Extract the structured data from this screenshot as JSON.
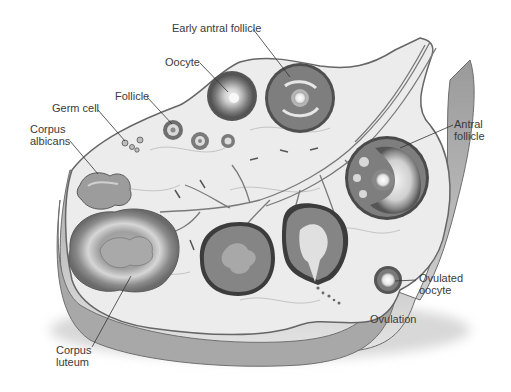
{
  "diagram": {
    "labels": {
      "early_antral_follicle": "Early antral follicle",
      "oocyte": "Oocyte",
      "follicle": "Follicle",
      "germ_cell": "Germ cell",
      "corpus_albicans_1": "Corpus",
      "corpus_albicans_2": "albicans",
      "antral_follicle_1": "Antral",
      "antral_follicle_2": "follicle",
      "ovulated_oocyte_1": "Ovulated",
      "ovulated_oocyte_2": "oocyte",
      "ovulation": "Ovulation",
      "corpus_luteum_1": "Corpus",
      "corpus_luteum_2": "luteum"
    },
    "colors": {
      "background": "#ffffff",
      "ovary_surface": "#e9e9e9",
      "ovary_edge": "#7a7a7a",
      "follicle_dark": "#6e6e6e",
      "follicle_light": "#d8d8d8",
      "label_text": "#3a3a3a",
      "leader_line": "#333333"
    }
  }
}
